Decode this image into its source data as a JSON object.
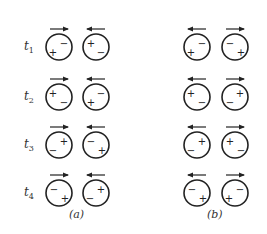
{
  "rows": [
    {
      "label": "t",
      "sub": "1",
      "y": 47,
      "a": [
        {
          "arrow": "right",
          "signs": [
            {
              "s": "−",
              "dx": 5,
              "dy": -4
            },
            {
              "s": "+",
              "dx": -6,
              "dy": 5
            }
          ]
        },
        {
          "arrow": "left",
          "signs": [
            {
              "s": "+",
              "dx": -5,
              "dy": -4
            },
            {
              "s": "−",
              "dx": 5,
              "dy": 5
            }
          ]
        }
      ],
      "b": [
        {
          "arrow": "left",
          "signs": [
            {
              "s": "−",
              "dx": 5,
              "dy": -4
            },
            {
              "s": "+",
              "dx": -6,
              "dy": 5
            }
          ]
        },
        {
          "arrow": "right",
          "signs": [
            {
              "s": "−",
              "dx": -5,
              "dy": -4
            },
            {
              "s": "+",
              "dx": 6,
              "dy": 5
            }
          ]
        }
      ]
    },
    {
      "label": "t",
      "sub": "2",
      "y": 97,
      "a": [
        {
          "arrow": "right",
          "signs": [
            {
              "s": "+",
              "dx": -6,
              "dy": -4
            },
            {
              "s": "−",
              "dx": 5,
              "dy": 5
            }
          ]
        },
        {
          "arrow": "left",
          "signs": [
            {
              "s": "−",
              "dx": 5,
              "dy": -4
            },
            {
              "s": "+",
              "dx": -5,
              "dy": 5
            }
          ]
        }
      ],
      "b": [
        {
          "arrow": "left",
          "signs": [
            {
              "s": "+",
              "dx": -6,
              "dy": -4
            },
            {
              "s": "−",
              "dx": 5,
              "dy": 5
            }
          ]
        },
        {
          "arrow": "right",
          "signs": [
            {
              "s": "+",
              "dx": 5,
              "dy": -4
            },
            {
              "s": "−",
              "dx": -5,
              "dy": 5
            }
          ]
        }
      ]
    },
    {
      "label": "t",
      "sub": "3",
      "y": 145,
      "a": [
        {
          "arrow": "right",
          "signs": [
            {
              "s": "+",
              "dx": 5,
              "dy": -4
            },
            {
              "s": "−",
              "dx": -6,
              "dy": 5
            }
          ]
        },
        {
          "arrow": "left",
          "signs": [
            {
              "s": "−",
              "dx": -5,
              "dy": -4
            },
            {
              "s": "+",
              "dx": 6,
              "dy": 5
            }
          ]
        }
      ],
      "b": [
        {
          "arrow": "left",
          "signs": [
            {
              "s": "+",
              "dx": 5,
              "dy": -4
            },
            {
              "s": "−",
              "dx": -6,
              "dy": 5
            }
          ]
        },
        {
          "arrow": "right",
          "signs": [
            {
              "s": "+",
              "dx": -5,
              "dy": -4
            },
            {
              "s": "−",
              "dx": 6,
              "dy": 5
            }
          ]
        }
      ]
    },
    {
      "label": "t",
      "sub": "4",
      "y": 193,
      "a": [
        {
          "arrow": "right",
          "signs": [
            {
              "s": "−",
              "dx": -5,
              "dy": -4
            },
            {
              "s": "+",
              "dx": 6,
              "dy": 5
            }
          ]
        },
        {
          "arrow": "left",
          "signs": [
            {
              "s": "+",
              "dx": 5,
              "dy": -4
            },
            {
              "s": "−",
              "dx": -6,
              "dy": 5
            }
          ]
        }
      ],
      "b": [
        {
          "arrow": "left",
          "signs": [
            {
              "s": "−",
              "dx": -5,
              "dy": -4
            },
            {
              "s": "+",
              "dx": 6,
              "dy": 5
            }
          ]
        },
        {
          "arrow": "right",
          "signs": [
            {
              "s": "−",
              "dx": 5,
              "dy": -4
            },
            {
              "s": "+",
              "dx": -6,
              "dy": 5
            }
          ]
        }
      ]
    }
  ],
  "columns": {
    "a": {
      "caption": "(a)",
      "cx": [
        59,
        96
      ]
    },
    "b": {
      "caption": "(b)",
      "cx": [
        197,
        235
      ]
    }
  },
  "style": {
    "stroke": "#222222",
    "radius": 13
  }
}
